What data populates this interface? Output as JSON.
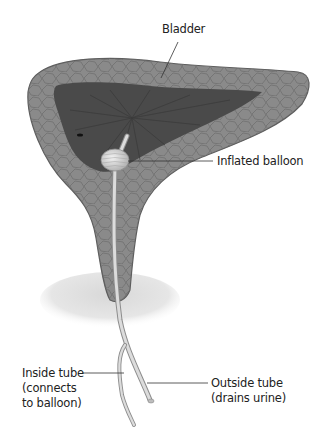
{
  "diagram": {
    "colors": {
      "wall": "#8a8a8a",
      "wall_outline": "#5e5e5e",
      "cavity": "#4a4a4a",
      "cavity_folds": "#3a3a3a",
      "tube": "#d4d4d4",
      "tube_outline": "#8c8c8c",
      "pelvic_shadow": "#e2e2e2",
      "leader_line": "#333333",
      "text": "#222222"
    },
    "labels": {
      "bladder": "Bladder",
      "balloon": "Inflated balloon",
      "inside_tube_line1": "Inside tube",
      "inside_tube_line2": "(connects",
      "inside_tube_line3": "to balloon)",
      "outside_tube_line1": "Outside tube",
      "outside_tube_line2": "(drains urine)"
    }
  }
}
